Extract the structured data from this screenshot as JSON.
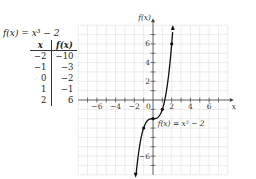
{
  "table": {
    "title": "f(x) = x³ − 2",
    "headers": [
      "x",
      "f(x)"
    ],
    "rows": [
      [
        "−2",
        "−10"
      ],
      [
        "−1",
        "−3"
      ],
      [
        "0",
        "−2"
      ],
      [
        "1",
        "−1"
      ],
      [
        "2",
        "6"
      ]
    ]
  },
  "chart_data": {
    "type": "line",
    "title": "f(x) = x³ − 2",
    "xlabel": "x",
    "ylabel": "f(x)",
    "x_ticks": [
      -6,
      -4,
      -2,
      2,
      4,
      6
    ],
    "y_ticks": [
      6,
      4,
      2,
      -6
    ],
    "origin_label": "0",
    "curve_label": "f(x) = x³ − 2",
    "xlim": [
      -8,
      8
    ],
    "ylim": [
      -8,
      8
    ],
    "grid": true,
    "points": [
      {
        "x": -1,
        "y": -3
      },
      {
        "x": 0,
        "y": -2
      },
      {
        "x": 1,
        "y": -1
      },
      {
        "x": 2,
        "y": 6
      }
    ],
    "series": [
      {
        "name": "f(x) = x³ − 2",
        "x": [
          -1.8,
          -1.5,
          -1,
          -0.5,
          0,
          0.5,
          1,
          1.5,
          1.8,
          2,
          2.1
        ],
        "y": [
          -7.83,
          -5.38,
          -3,
          -2.13,
          -2,
          -1.88,
          -1,
          1.38,
          3.83,
          6,
          7.26
        ]
      }
    ]
  }
}
